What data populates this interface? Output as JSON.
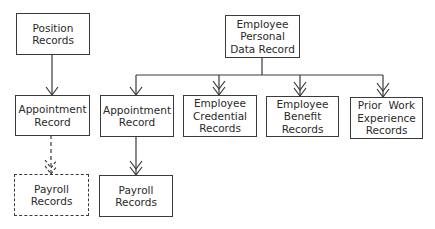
{
  "diagram": {
    "nodes": [
      {
        "id": "position_records",
        "lines": [
          "Position",
          "Records"
        ],
        "style": "solid"
      },
      {
        "id": "appointment_record_left",
        "lines": [
          "Appointment",
          "Record"
        ],
        "style": "solid"
      },
      {
        "id": "payroll_records_left",
        "lines": [
          "Payroll",
          "Records"
        ],
        "style": "dashed"
      },
      {
        "id": "employee_personal_data_record",
        "lines": [
          "Employee",
          "Personal",
          "Data Record"
        ],
        "style": "solid"
      },
      {
        "id": "appointment_record_right",
        "lines": [
          "Appointment",
          "Record"
        ],
        "style": "solid"
      },
      {
        "id": "employee_credential_records",
        "lines": [
          "Employee",
          "Credential",
          "Records"
        ],
        "style": "solid"
      },
      {
        "id": "employee_benefit_records",
        "lines": [
          "Employee",
          "Benefit",
          "Records"
        ],
        "style": "solid"
      },
      {
        "id": "prior_work_experience_records",
        "lines": [
          "Prior  Work",
          "Experience",
          "Records"
        ],
        "style": "solid"
      },
      {
        "id": "payroll_records_right",
        "lines": [
          "Payroll",
          "Records"
        ],
        "style": "solid"
      }
    ],
    "edges": [
      {
        "from": "position_records",
        "to": "appointment_record_left",
        "type": "one-to-one",
        "style": "solid"
      },
      {
        "from": "appointment_record_left",
        "to": "payroll_records_left",
        "type": "one-to-many",
        "style": "dashed"
      },
      {
        "from": "employee_personal_data_record",
        "to": "appointment_record_right",
        "type": "one-to-one",
        "style": "solid"
      },
      {
        "from": "employee_personal_data_record",
        "to": "employee_credential_records",
        "type": "one-to-many",
        "style": "solid"
      },
      {
        "from": "employee_personal_data_record",
        "to": "employee_benefit_records",
        "type": "one-to-many",
        "style": "solid"
      },
      {
        "from": "employee_personal_data_record",
        "to": "prior_work_experience_records",
        "type": "one-to-many",
        "style": "solid"
      },
      {
        "from": "appointment_record_right",
        "to": "payroll_records_right",
        "type": "one-to-many",
        "style": "solid"
      }
    ],
    "colors": {
      "line": "#3a3a3a",
      "background": "#ffffff",
      "text": "#2a2a2a"
    }
  }
}
